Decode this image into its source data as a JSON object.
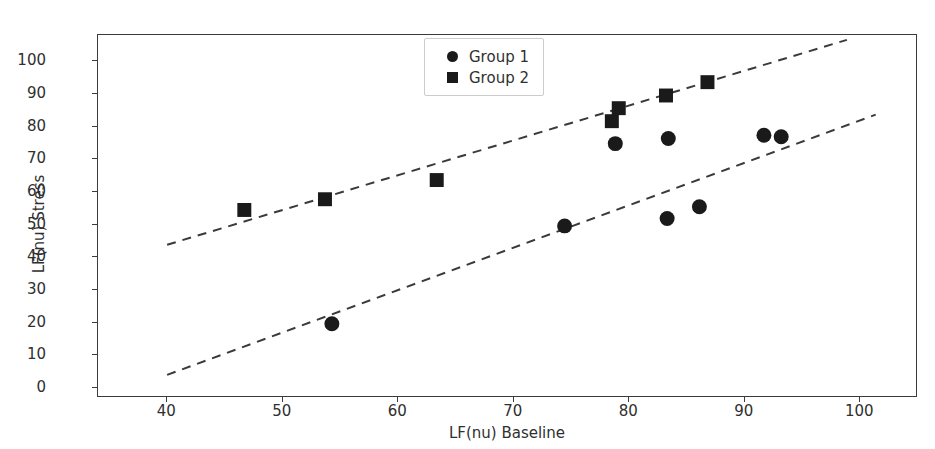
{
  "chart_data": {
    "type": "scatter",
    "title": "",
    "xlabel": "LF(nu) Baseline",
    "ylabel": "LF(nu) Stress",
    "xlim": [
      34,
      105
    ],
    "ylim": [
      -3,
      108
    ],
    "xticks": [
      40,
      50,
      60,
      70,
      80,
      90,
      100
    ],
    "yticks": [
      0,
      10,
      20,
      30,
      40,
      50,
      60,
      70,
      80,
      90,
      100
    ],
    "grid": false,
    "legend_position": "upper center",
    "marker_color": "#1a1a1a",
    "trendline_color": "#3a3a3a",
    "trendline_style": "dashed",
    "series": [
      {
        "name": "Group 1",
        "marker": "circle",
        "points": [
          {
            "x": 54.3,
            "y": 19.2
          },
          {
            "x": 74.5,
            "y": 49.3
          },
          {
            "x": 78.9,
            "y": 74.6
          },
          {
            "x": 83.4,
            "y": 51.6
          },
          {
            "x": 83.5,
            "y": 76.2
          },
          {
            "x": 86.2,
            "y": 55.2
          },
          {
            "x": 91.8,
            "y": 77.2
          },
          {
            "x": 93.3,
            "y": 76.7
          }
        ],
        "trendline": {
          "x1": 40.0,
          "y1": 3.5,
          "x2": 101.5,
          "y2": 83.5
        }
      },
      {
        "name": "Group 2",
        "marker": "square",
        "points": [
          {
            "x": 46.7,
            "y": 54.2
          },
          {
            "x": 53.7,
            "y": 57.5
          },
          {
            "x": 63.4,
            "y": 63.4
          },
          {
            "x": 78.6,
            "y": 81.5
          },
          {
            "x": 79.2,
            "y": 85.5
          },
          {
            "x": 83.3,
            "y": 89.4
          },
          {
            "x": 86.9,
            "y": 93.5
          }
        ],
        "trendline": {
          "x1": 40.0,
          "y1": 43.5,
          "x2": 99.0,
          "y2": 106.5
        }
      }
    ]
  },
  "legend": {
    "entries": [
      {
        "label": "Group 1",
        "marker": "circle"
      },
      {
        "label": "Group 2",
        "marker": "square"
      }
    ]
  },
  "axes": {
    "x_title": "LF(nu) Baseline",
    "y_title": "LF(nu) Stress",
    "x_tick_labels": [
      "40",
      "50",
      "60",
      "70",
      "80",
      "90",
      "100"
    ],
    "y_tick_labels": [
      "0",
      "10",
      "20",
      "30",
      "40",
      "50",
      "60",
      "70",
      "80",
      "90",
      "100"
    ]
  }
}
